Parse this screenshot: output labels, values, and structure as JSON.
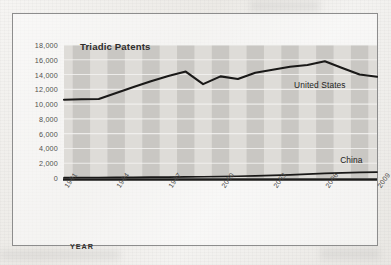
{
  "figure": {
    "title": "Triadic Patents",
    "xaxis_title": "YEAR",
    "series_labels": {
      "us": "United States",
      "china": "China"
    }
  },
  "chart_data": {
    "type": "line",
    "title": "Triadic Patents",
    "xlabel": "YEAR",
    "ylabel": "",
    "xlim": [
      1991,
      2009
    ],
    "ylim": [
      0,
      18000
    ],
    "ytick_step": 2000,
    "grid": "horizontal-white-gridlines",
    "background": "alternating vertical gray bands, one per year",
    "legend": "inline labels at right end of each series",
    "x": [
      1991,
      1992,
      1993,
      1994,
      1995,
      1996,
      1997,
      1998,
      1999,
      2000,
      2001,
      2002,
      2003,
      2004,
      2005,
      2006,
      2007,
      2008,
      2009
    ],
    "xticks": [
      "1991",
      "1994",
      "1997",
      "2000",
      "2003",
      "2006",
      "2009"
    ],
    "yticks": [
      "0",
      "2,000",
      "4,000",
      "6,000",
      "8,000",
      "10,000",
      "12,000",
      "14,000",
      "16,000",
      "18,000"
    ],
    "series": [
      {
        "name": "United States",
        "values": [
          10600,
          10650,
          10700,
          11500,
          12300,
          13100,
          13800,
          14400,
          12700,
          13750,
          13400,
          14250,
          14650,
          15050,
          15300,
          15800,
          14900,
          14000,
          13700
        ]
      },
      {
        "name": "China",
        "values": [
          60,
          65,
          70,
          80,
          95,
          110,
          130,
          150,
          170,
          200,
          240,
          290,
          350,
          430,
          520,
          620,
          700,
          760,
          800
        ]
      }
    ]
  }
}
